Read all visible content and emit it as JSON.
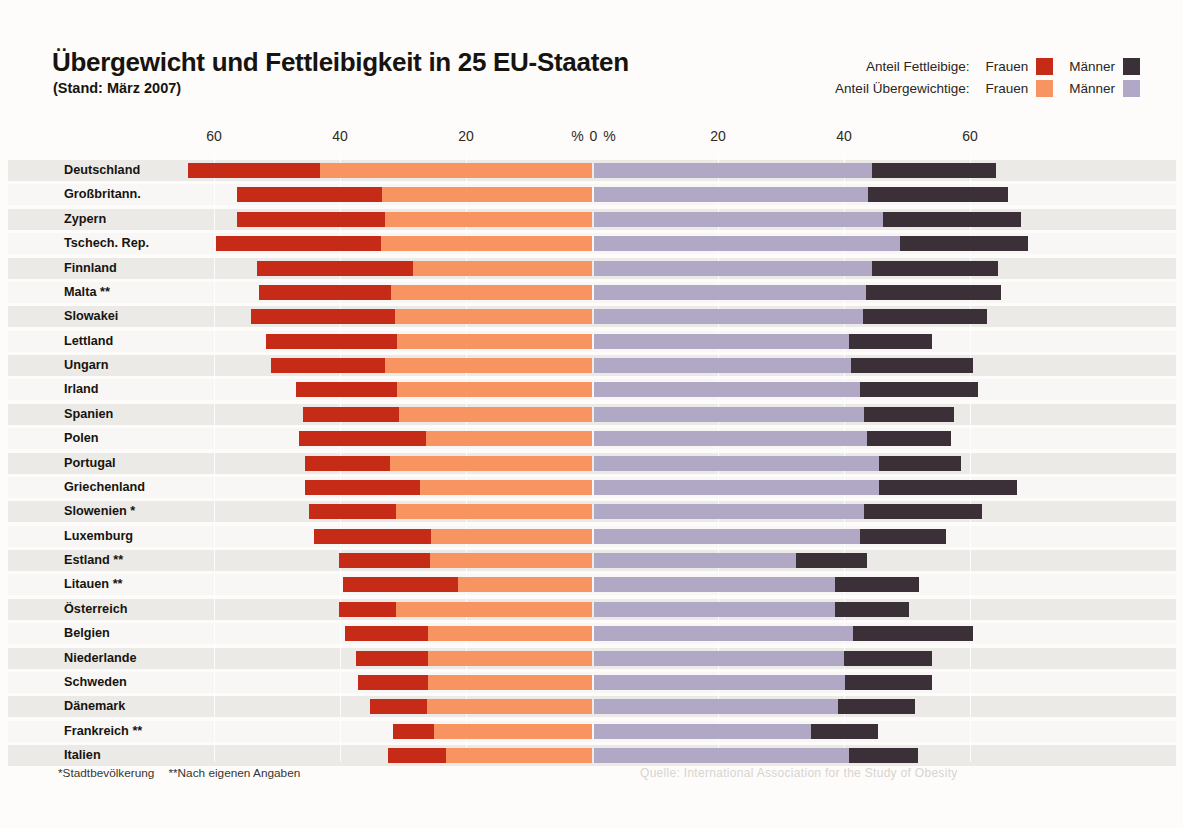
{
  "header": {
    "title": "Übergewicht und Fettleibigkeit in 25 EU-Staaten",
    "subtitle": "(Stand: März 2007)"
  },
  "legend": {
    "rows": [
      {
        "caption": "Anteil Fettleibige:",
        "items": [
          {
            "name": "Frauen",
            "color": "#c52b17",
            "key": "obese_women"
          },
          {
            "name": "Männer",
            "color": "#3c3038",
            "key": "obese_men"
          }
        ]
      },
      {
        "caption": "Anteil Übergewichtige:",
        "items": [
          {
            "name": "Frauen",
            "color": "#f79461",
            "key": "overweight_women"
          },
          {
            "name": "Männer",
            "color": "#b0a8c4",
            "key": "overweight_men"
          }
        ]
      }
    ]
  },
  "axis": {
    "left_ticks": [
      "60",
      "40",
      "20"
    ],
    "center_label": "% 0 %",
    "right_ticks": [
      "20",
      "40",
      "60"
    ]
  },
  "footnotes": {
    "one_star": "*Stadtbevölkerung",
    "two_star": "**Nach eigenen Angaben",
    "source": "Quelle: International Association for the Study of Obesity"
  },
  "colors": {
    "obese_women": "#c52b17",
    "overweight_women": "#f79461",
    "overweight_men": "#b0a8c4",
    "obese_men": "#3c3038",
    "band": "#eceae7",
    "background": "#fdfcfa"
  },
  "chart_data": {
    "type": "bar",
    "title": "Übergewicht und Fettleibigkeit in 25 EU-Staaten",
    "subtitle": "(Stand: März 2007)",
    "orientation": "horizontal",
    "layout": "diverging-stacked (women left, men right)",
    "xlabel": "%",
    "ylabel": "",
    "grid": true,
    "legend_position": "top-right",
    "xlim_left": [
      0,
      65
    ],
    "xlim_right": [
      0,
      68
    ],
    "left_tick_values": [
      60,
      40,
      20,
      0
    ],
    "right_tick_values": [
      0,
      20,
      40,
      60
    ],
    "categories": [
      "Deutschland",
      "Großbritann.",
      "Zypern",
      "Tschech. Rep.",
      "Finnland",
      "Malta **",
      "Slowakei",
      "Lettland",
      "Ungarn",
      "Irland",
      "Spanien",
      "Polen",
      "Portugal",
      "Griechenland",
      "Slowenien *",
      "Luxemburg",
      "Estland **",
      "Litauen **",
      "Österreich",
      "Belgien",
      "Niederlande",
      "Schweden",
      "Dänemark",
      "Frankreich **",
      "Italien"
    ],
    "series": [
      {
        "name": "Anteil Fettleibige: Frauen",
        "key": "obese_women",
        "color": "#c52b17",
        "side": "left",
        "values": [
          21.1,
          23.0,
          23.5,
          26.2,
          24.8,
          21.0,
          22.9,
          20.8,
          18.2,
          16.0,
          15.2,
          20.2,
          13.4,
          18.2,
          13.8,
          18.6,
          14.4,
          18.2,
          9.1,
          13.1,
          11.4,
          11.0,
          9.1,
          6.6,
          9.3
        ]
      },
      {
        "name": "Anteil Übergewichtige: Frauen",
        "key": "overweight_women",
        "color": "#f79461",
        "side": "left",
        "values": [
          43.1,
          33.4,
          32.8,
          33.5,
          28.4,
          31.9,
          31.2,
          30.9,
          32.8,
          31.0,
          30.7,
          26.3,
          32.1,
          27.3,
          31.1,
          25.5,
          25.7,
          21.3,
          31.1,
          26.1,
          26.1,
          26.1,
          26.2,
          25.0,
          23.1
        ]
      },
      {
        "name": "Anteil Übergewichtige: Männer",
        "key": "overweight_men",
        "color": "#b0a8c4",
        "side": "right",
        "values": [
          44.2,
          43.5,
          45.8,
          48.5,
          44.2,
          43.1,
          42.7,
          40.4,
          40.8,
          42.3,
          42.8,
          43.3,
          45.2,
          45.3,
          42.8,
          42.3,
          32.0,
          38.2,
          38.3,
          41.1,
          39.7,
          39.8,
          38.7,
          34.5,
          40.5
        ]
      },
      {
        "name": "Anteil Fettleibige: Männer",
        "key": "obese_men",
        "color": "#3c3038",
        "side": "right",
        "values": [
          19.6,
          22.2,
          22.0,
          20.4,
          19.9,
          21.5,
          19.7,
          13.2,
          19.4,
          18.7,
          14.3,
          13.3,
          13.0,
          21.9,
          18.8,
          13.5,
          11.3,
          13.4,
          11.7,
          19.1,
          13.9,
          13.8,
          12.2,
          10.6,
          11.0
        ]
      }
    ]
  }
}
